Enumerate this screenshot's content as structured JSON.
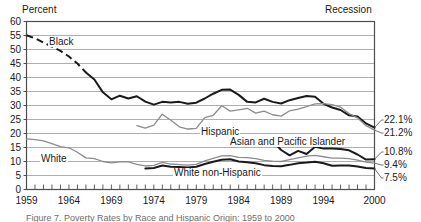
{
  "chart_data": {
    "type": "line",
    "title": "",
    "xlabel": "",
    "ylabel": "Percent",
    "xlim": [
      1959,
      2000
    ],
    "ylim": [
      0,
      60
    ],
    "yticks": [
      0,
      5,
      10,
      15,
      20,
      25,
      30,
      35,
      40,
      45,
      50,
      55,
      60
    ],
    "xticks": [
      1959,
      1964,
      1969,
      1974,
      1979,
      1984,
      1989,
      1994,
      2000
    ],
    "grid": true,
    "legend_position": "inline-annotations",
    "top_left_note": "Percent",
    "top_right_note": "Recession",
    "caption": "Figure 7. Poverty Rates by Race and Hispanic Origin: 1959 to 2000",
    "series": [
      {
        "name": "Black",
        "label": "Black",
        "color": "#1a1a1a",
        "end_value": "22.1%",
        "dashed_segment_years": [
          1959,
          1966
        ],
        "x": [
          1959,
          1960,
          1961,
          1962,
          1963,
          1964,
          1965,
          1966,
          1967,
          1968,
          1969,
          1970,
          1971,
          1972,
          1973,
          1974,
          1975,
          1976,
          1977,
          1978,
          1979,
          1980,
          1981,
          1982,
          1983,
          1984,
          1985,
          1986,
          1987,
          1988,
          1989,
          1990,
          1991,
          1992,
          1993,
          1994,
          1995,
          1996,
          1997,
          1998,
          1999,
          2000
        ],
        "values": [
          55.1,
          54.0,
          52.5,
          51.0,
          49.5,
          47.5,
          45.0,
          41.8,
          39.3,
          34.7,
          32.2,
          33.5,
          32.5,
          33.3,
          31.4,
          30.3,
          31.3,
          31.1,
          31.3,
          30.6,
          31.0,
          32.5,
          34.2,
          35.6,
          35.7,
          33.8,
          31.3,
          31.1,
          32.4,
          31.3,
          30.7,
          31.9,
          32.7,
          33.4,
          33.1,
          30.6,
          29.3,
          28.4,
          26.5,
          26.1,
          23.6,
          22.1
        ]
      },
      {
        "name": "Hispanic",
        "label": "Hispanic",
        "color": "#8c8c8c",
        "end_value": "21.2%",
        "x": [
          1972,
          1973,
          1974,
          1975,
          1976,
          1977,
          1978,
          1979,
          1980,
          1981,
          1982,
          1983,
          1984,
          1985,
          1986,
          1987,
          1988,
          1989,
          1990,
          1991,
          1992,
          1993,
          1994,
          1995,
          1996,
          1997,
          1998,
          1999,
          2000
        ],
        "values": [
          22.8,
          21.9,
          23.0,
          26.9,
          24.7,
          22.4,
          21.6,
          21.8,
          25.7,
          26.5,
          29.9,
          28.0,
          28.4,
          29.0,
          27.3,
          28.0,
          26.7,
          26.2,
          28.1,
          28.7,
          29.6,
          30.6,
          30.7,
          30.3,
          29.4,
          27.1,
          25.6,
          22.8,
          21.2
        ]
      },
      {
        "name": "Asian and Pacific Islander",
        "label": "Asian and Pacific Islander",
        "color": "#1a1a1a",
        "end_value": "10.8%",
        "x": [
          1987,
          1988,
          1989,
          1990,
          1991,
          1992,
          1993,
          1994,
          1995,
          1996,
          1997,
          1998,
          1999,
          2000
        ],
        "values": [
          16.1,
          17.3,
          14.1,
          12.2,
          13.8,
          12.7,
          15.3,
          14.6,
          14.6,
          14.5,
          14.0,
          12.5,
          10.7,
          10.8
        ]
      },
      {
        "name": "White",
        "label": "White",
        "color": "#8c8c8c",
        "end_value": "9.4%",
        "x": [
          1959,
          1960,
          1961,
          1962,
          1963,
          1964,
          1965,
          1966,
          1967,
          1968,
          1969,
          1970,
          1971,
          1972,
          1973,
          1974,
          1975,
          1976,
          1977,
          1978,
          1979,
          1980,
          1981,
          1982,
          1983,
          1984,
          1985,
          1986,
          1987,
          1988,
          1989,
          1990,
          1991,
          1992,
          1993,
          1994,
          1995,
          1996,
          1997,
          1998,
          1999,
          2000
        ],
        "values": [
          18.1,
          17.8,
          17.4,
          16.4,
          15.3,
          14.9,
          13.3,
          11.3,
          11.0,
          10.0,
          9.5,
          9.9,
          9.9,
          9.0,
          8.4,
          8.6,
          9.7,
          9.1,
          8.9,
          8.7,
          9.0,
          10.2,
          11.1,
          12.0,
          12.1,
          11.5,
          11.4,
          11.0,
          10.4,
          10.1,
          10.0,
          10.7,
          11.3,
          11.9,
          12.2,
          11.7,
          11.2,
          11.2,
          11.0,
          10.5,
          9.8,
          9.4
        ]
      },
      {
        "name": "White non-Hispanic",
        "label": "White non-Hispanic",
        "color": "#1a1a1a",
        "end_value": "7.5%",
        "x": [
          1973,
          1974,
          1975,
          1976,
          1977,
          1978,
          1979,
          1980,
          1981,
          1982,
          1983,
          1984,
          1985,
          1986,
          1987,
          1988,
          1989,
          1990,
          1991,
          1992,
          1993,
          1994,
          1995,
          1996,
          1997,
          1998,
          1999,
          2000
        ],
        "values": [
          7.5,
          7.7,
          8.6,
          8.1,
          8.0,
          7.9,
          8.1,
          9.1,
          9.9,
          10.6,
          10.8,
          10.0,
          9.7,
          9.4,
          8.7,
          8.4,
          8.3,
          8.8,
          9.4,
          9.6,
          9.9,
          9.4,
          8.5,
          8.6,
          8.6,
          8.2,
          7.7,
          7.5
        ]
      }
    ],
    "end_labels": [
      {
        "value": "22.1%",
        "series": "Black"
      },
      {
        "value": "21.2%",
        "series": "Hispanic"
      },
      {
        "value": "10.8%",
        "series": "Asian and Pacific Islander"
      },
      {
        "value": "9.4%",
        "series": "White"
      },
      {
        "value": "7.5%",
        "series": "White non-Hispanic"
      }
    ]
  }
}
